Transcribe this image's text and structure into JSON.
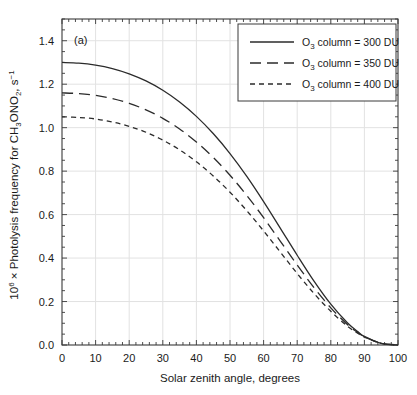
{
  "figure": {
    "panel_label": "(a)",
    "background_color": "#ffffff",
    "frame_color": "#3a3a3a",
    "grid_color": "#e2e2e2",
    "line_color": "#2b2b2b"
  },
  "axes": {
    "x": {
      "title": "Solar zenith angle, degrees",
      "min": 0,
      "max": 100,
      "major_step": 10,
      "minor_step": 2,
      "tick_labels": [
        "0",
        "10",
        "20",
        "30",
        "40",
        "50",
        "60",
        "70",
        "80",
        "90",
        "100"
      ]
    },
    "y": {
      "title_parts": {
        "prefix": "10",
        "exponent": "6",
        "middle": " × Photolysis frequency for CH",
        "sub1": "3",
        "mid2": "ONO",
        "sub2": "2",
        "mid3": ", s",
        "exponent2": "−1"
      },
      "title_plain": "10⁶ × Photolysis frequency for CH₃ONO₂, s⁻¹",
      "min": 0.0,
      "max": 1.5,
      "major_step": 0.2,
      "minor_step": 0.05,
      "tick_labels": [
        "0.0",
        "0.2",
        "0.4",
        "0.6",
        "0.8",
        "1.0",
        "1.2",
        "1.4"
      ],
      "tick_values": [
        0.0,
        0.2,
        0.4,
        0.6,
        0.8,
        1.0,
        1.2,
        1.4
      ]
    }
  },
  "legend": {
    "entries": [
      {
        "label": "O₃ column = 300 DU",
        "dash": "none",
        "style_name": "solid"
      },
      {
        "label": "O₃ column = 350 DU",
        "dash": "11,6",
        "style_name": "long-dash"
      },
      {
        "label": "O₃ column = 400 DU",
        "dash": "5,4",
        "style_name": "short-dash"
      }
    ],
    "entry_text_parts": [
      {
        "pre": "O",
        "sub": "3",
        "post": " column = 300 DU"
      },
      {
        "pre": "O",
        "sub": "3",
        "post": " column = 350 DU"
      },
      {
        "pre": "O",
        "sub": "3",
        "post": " column = 400 DU"
      }
    ]
  },
  "chart_data": {
    "type": "line",
    "title": "",
    "xlabel": "Solar zenith angle, degrees",
    "ylabel": "10⁶ × Photolysis frequency for CH₃ONO₂, s⁻¹",
    "xlim": [
      0,
      100
    ],
    "ylim": [
      0.0,
      1.5
    ],
    "grid": true,
    "legend_position": "top-right",
    "annotations": [
      "(a)"
    ],
    "x": [
      0,
      5,
      10,
      15,
      20,
      25,
      30,
      35,
      40,
      45,
      50,
      55,
      60,
      65,
      70,
      75,
      80,
      85,
      88,
      90,
      95,
      100
    ],
    "series": [
      {
        "name": "O3 column = 300 DU",
        "style": "solid",
        "values": [
          1.3,
          1.297,
          1.288,
          1.272,
          1.248,
          1.215,
          1.172,
          1.118,
          1.052,
          0.973,
          0.881,
          0.776,
          0.66,
          0.537,
          0.413,
          0.294,
          0.188,
          0.101,
          0.062,
          0.04,
          0.008,
          0.0
        ]
      },
      {
        "name": "O3 column = 350 DU",
        "style": "long-dash",
        "values": [
          1.16,
          1.157,
          1.149,
          1.134,
          1.112,
          1.082,
          1.043,
          0.994,
          0.934,
          0.863,
          0.781,
          0.688,
          0.586,
          0.477,
          0.368,
          0.264,
          0.171,
          0.093,
          0.058,
          0.038,
          0.008,
          0.0
        ]
      },
      {
        "name": "O3 column = 400 DU",
        "style": "short-dash",
        "values": [
          1.05,
          1.047,
          1.04,
          1.026,
          1.006,
          0.979,
          0.943,
          0.898,
          0.843,
          0.778,
          0.703,
          0.618,
          0.525,
          0.427,
          0.329,
          0.237,
          0.155,
          0.086,
          0.054,
          0.036,
          0.008,
          0.0
        ]
      }
    ]
  }
}
